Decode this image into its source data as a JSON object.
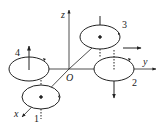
{
  "diagram": {
    "type": "quadrotor-coordinate-frame",
    "axes": {
      "x": "x",
      "y": "y",
      "z": "z",
      "origin": "O"
    },
    "rotors": [
      {
        "id": "1",
        "label": "1",
        "thrust_arrow": "none",
        "center_dot": true
      },
      {
        "id": "2",
        "label": "2",
        "thrust_arrow": "down",
        "center_dot": false
      },
      {
        "id": "3",
        "label": "3",
        "thrust_arrow": "none",
        "center_dot": true
      },
      {
        "id": "4",
        "label": "4",
        "thrust_arrow": "up",
        "center_dot": false
      }
    ],
    "extra_arrows": [
      {
        "near": "3",
        "direction": "right"
      }
    ],
    "colors": {
      "stroke": "#222222",
      "background": "#ffffff"
    }
  }
}
